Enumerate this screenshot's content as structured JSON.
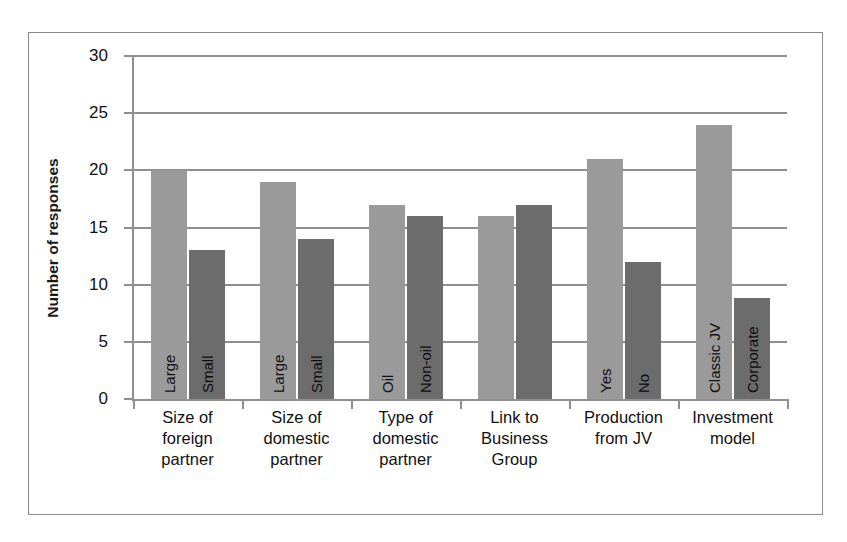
{
  "chart_data": {
    "type": "bar",
    "title": "",
    "xlabel": "",
    "ylabel": "Number of responses",
    "ylim": [
      0,
      30
    ],
    "yticks": [
      0,
      5,
      10,
      15,
      20,
      25,
      30
    ],
    "grid": true,
    "legend": "none",
    "bar_label_orientation": "vertical",
    "colors": {
      "series_1": "#9a9a9a",
      "series_2": "#6c6c6c",
      "axis": "#8f8f8f",
      "frame": "#8a8a8a",
      "text": "#111111"
    },
    "categories": [
      "Size of foreign partner",
      "Size of domestic partner",
      "Type of domestic partner",
      "Link to Business Group",
      "Production from JV",
      "Investment model"
    ],
    "category_lines": [
      [
        "Size of",
        "foreign",
        "partner"
      ],
      [
        "Size of",
        "domestic",
        "partner"
      ],
      [
        "Type of",
        "domestic",
        "partner"
      ],
      [
        "Link to",
        "Business",
        "Group"
      ],
      [
        "Production",
        "from JV"
      ],
      [
        "Investment",
        "model"
      ]
    ],
    "groups": [
      {
        "category": "Size of foreign partner",
        "bars": [
          {
            "label": "Large",
            "value": 20,
            "series": 1
          },
          {
            "label": "Small",
            "value": 13,
            "series": 2
          }
        ]
      },
      {
        "category": "Size of domestic partner",
        "bars": [
          {
            "label": "Large",
            "value": 19,
            "series": 1
          },
          {
            "label": "Small",
            "value": 14,
            "series": 2
          }
        ]
      },
      {
        "category": "Type of domestic partner",
        "bars": [
          {
            "label": "Oil",
            "value": 17,
            "series": 1
          },
          {
            "label": "Non-oil",
            "value": 16,
            "series": 2
          }
        ]
      },
      {
        "category": "Link to Business Group",
        "bars": [
          {
            "label": "",
            "value": 16,
            "series": 1
          },
          {
            "label": "",
            "value": 17,
            "series": 2
          }
        ]
      },
      {
        "category": "Production from JV",
        "bars": [
          {
            "label": "Yes",
            "value": 21,
            "series": 1
          },
          {
            "label": "No",
            "value": 12,
            "series": 2
          }
        ]
      },
      {
        "category": "Investment model",
        "bars": [
          {
            "label": "Classic JV",
            "value": 24,
            "series": 1
          },
          {
            "label": "Corporate",
            "value": 8.8,
            "series": 2
          }
        ]
      }
    ]
  }
}
